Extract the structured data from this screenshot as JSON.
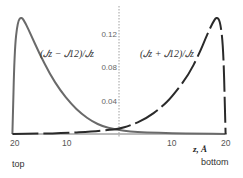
{
  "chart_data": {
    "type": "line",
    "title": "",
    "xlabel": "z, Å",
    "ylabel": "",
    "x_tick_labels": [
      "20",
      "10",
      "10",
      "20"
    ],
    "y_tick_labels": [
      "0.04",
      "0.08",
      "0.12"
    ],
    "ylim": [
      0,
      0.145
    ],
    "xlim": [
      -20,
      20
    ],
    "grid": false,
    "legend_position": "inline annotations",
    "series": [
      {
        "name": "(J_z − J_12)/J_z",
        "style": "solid",
        "color": "#666666",
        "x": [
          -20,
          -19.6,
          -19,
          -18.3,
          -17.5,
          -16.5,
          -15,
          -13,
          -11,
          -9,
          -7,
          -5,
          -3,
          -1,
          0,
          2,
          5,
          10,
          15,
          20
        ],
        "values": [
          0.0,
          0.1,
          0.135,
          0.14,
          0.132,
          0.118,
          0.097,
          0.072,
          0.052,
          0.036,
          0.024,
          0.015,
          0.009,
          0.006,
          0.005,
          0.003,
          0.002,
          0.001,
          0.0005,
          0.0
        ]
      },
      {
        "name": "(J_z + J_12)/J_z",
        "style": "dashed",
        "color": "#222222",
        "x": [
          -20,
          -15,
          -10,
          -5,
          -2,
          0,
          2,
          5,
          8,
          10,
          13,
          15,
          16.5,
          17.5,
          18.3,
          19,
          19.6,
          20
        ],
        "values": [
          0.0,
          0.0005,
          0.001,
          0.003,
          0.005,
          0.006,
          0.01,
          0.018,
          0.032,
          0.045,
          0.07,
          0.095,
          0.118,
          0.132,
          0.14,
          0.135,
          0.1,
          0.0
        ]
      }
    ],
    "annotations": [
      {
        "text": "(J_z − J_12)/J_z",
        "x": -13,
        "y": 0.1
      },
      {
        "text": "(J_z + J_12)/J_z",
        "x": 9,
        "y": 0.1
      }
    ]
  },
  "labels": {
    "series1": "(𝐽z − 𝐽12)/𝐽z",
    "series2": "(𝐽z + 𝐽12)/𝐽z",
    "xaxis": "z, Å",
    "top": "top",
    "bottom": "bottom",
    "xticks": [
      "20",
      "10",
      "10",
      "20"
    ],
    "yticks": [
      "0.04",
      "0.08",
      "0.12"
    ]
  }
}
